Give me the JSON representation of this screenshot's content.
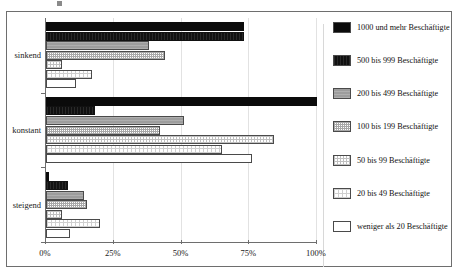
{
  "page": {
    "top_remnant_text": "",
    "background": "#ffffff"
  },
  "chart_data": {
    "type": "bar",
    "orientation": "horizontal",
    "title": "",
    "xlabel": "",
    "ylabel": "",
    "grid": true,
    "legend_position": "right",
    "xlim": [
      0,
      100
    ],
    "x_ticks": [
      "0%",
      "25%",
      "50%",
      "75%",
      "100%"
    ],
    "x_tick_values": [
      0,
      25,
      50,
      75,
      100
    ],
    "categories": [
      "sinkend",
      "konstant",
      "steigend"
    ],
    "series": [
      {
        "name": "1000 und mehr Beschäftigte",
        "pattern": "solid-black",
        "color": "#0b0b0b",
        "values": [
          73,
          100,
          1
        ]
      },
      {
        "name": "500 bis 999 Beschäftigte",
        "pattern": "black-hatch",
        "color": "#111111",
        "values": [
          73,
          18,
          8
        ]
      },
      {
        "name": "200 bis 499 Beschäftigte",
        "pattern": "grey",
        "color": "#9d9d9d",
        "values": [
          38,
          51,
          14
        ]
      },
      {
        "name": "100 bis 199 Beschäftigte",
        "pattern": "checker",
        "color": "#a8a8a8",
        "values": [
          44,
          42,
          15
        ]
      },
      {
        "name": "50 bis 99 Beschäftigte",
        "pattern": "fine-dot",
        "color": "#c0c0c0",
        "values": [
          6,
          84,
          6
        ]
      },
      {
        "name": "20 bis 49 Beschäftigte",
        "pattern": "sparse-dot",
        "color": "#cfcfcf",
        "values": [
          17,
          65,
          20
        ]
      },
      {
        "name": "weniger als 20 Beschäftigte",
        "pattern": "white",
        "color": "#ffffff",
        "values": [
          11,
          76,
          9
        ]
      }
    ]
  },
  "legend": {
    "items": [
      {
        "label": "1000 und mehr Beschäftigte"
      },
      {
        "label": "500 bis 999 Beschäftigte"
      },
      {
        "label": "200 bis 499 Beschäftigte"
      },
      {
        "label": "100 bis 199 Beschäftigte"
      },
      {
        "label": "50 bis 99 Beschäftigte"
      },
      {
        "label": "20 bis 49 Beschäftigte"
      },
      {
        "label": "weniger als 20 Beschäftigte"
      }
    ]
  }
}
